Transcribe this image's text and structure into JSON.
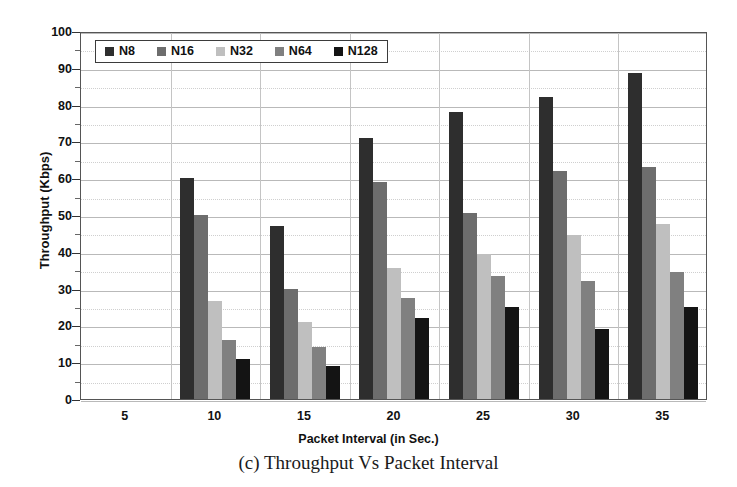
{
  "caption": "(c) Throughput Vs Packet Interval",
  "chart_data": {
    "type": "bar",
    "title": "",
    "xlabel": "Packet Interval (in Sec.)",
    "ylabel": "Throughput (Kbps)",
    "categories": [
      "5",
      "10",
      "15",
      "20",
      "25",
      "30",
      "35"
    ],
    "ylim": [
      0,
      100
    ],
    "ytick_labels": [
      "0",
      "10",
      "20",
      "30",
      "40",
      "50",
      "60",
      "70",
      "80",
      "90",
      "100"
    ],
    "ytick_values": [
      0,
      10,
      20,
      30,
      40,
      50,
      60,
      70,
      80,
      90,
      100
    ],
    "y_minor_step": 5,
    "grid": true,
    "legend_position": "top-left",
    "series": [
      {
        "name": "N8",
        "color": "#2e2e2e",
        "values": [
          null,
          60,
          47,
          71,
          78,
          82,
          88.5
        ]
      },
      {
        "name": "N16",
        "color": "#6d6d6d",
        "values": [
          null,
          50,
          30,
          59,
          50.5,
          62,
          63
        ]
      },
      {
        "name": "N32",
        "color": "#bfbfbf",
        "values": [
          null,
          26.5,
          21,
          35.5,
          39.5,
          44.5,
          47.5
        ]
      },
      {
        "name": "N64",
        "color": "#808080",
        "values": [
          null,
          16,
          14,
          27.5,
          33.5,
          32,
          34.5
        ]
      },
      {
        "name": "N128",
        "color": "#141414",
        "values": [
          null,
          11,
          9,
          22,
          25,
          19,
          25
        ]
      }
    ]
  }
}
